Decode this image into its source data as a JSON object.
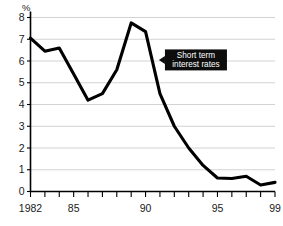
{
  "chart_data": {
    "type": "line",
    "title": "",
    "subtitle": "",
    "xlabel": "",
    "ylabel": "%",
    "unit_label": "%",
    "xlim": [
      1982,
      1999
    ],
    "ylim": [
      0,
      8
    ],
    "grid": true,
    "legend_position": "none",
    "y_ticks": [
      "8",
      "7",
      "6",
      "5",
      "4",
      "3",
      "2",
      "1",
      "0"
    ],
    "y_tick_values": [
      8,
      7,
      6,
      5,
      4,
      3,
      2,
      1,
      0
    ],
    "x_ticks": [
      "1982",
      "85",
      "90",
      "95",
      "99"
    ],
    "x_tick_values": [
      1982,
      1985,
      1990,
      1995,
      1999
    ],
    "x_minor_tick_values": [
      1982,
      1983,
      1984,
      1985,
      1986,
      1987,
      1988,
      1989,
      1990,
      1991,
      1992,
      1993,
      1994,
      1995,
      1996,
      1997,
      1998,
      1999
    ],
    "series": [
      {
        "name": "Short term interest rates",
        "color": "#000000",
        "x": [
          1982,
          1983,
          1984,
          1985,
          1986,
          1987,
          1988,
          1989,
          1990,
          1991,
          1992,
          1993,
          1994,
          1995,
          1996,
          1997,
          1998,
          1999
        ],
        "values": [
          7.05,
          6.45,
          6.6,
          5.4,
          4.2,
          4.5,
          5.6,
          7.75,
          7.35,
          4.5,
          3.0,
          2.0,
          1.2,
          0.62,
          0.6,
          0.7,
          0.3,
          0.42
        ]
      }
    ],
    "annotations": [
      {
        "name": "short-term-interest-rates-callout",
        "line1": "Short term",
        "line2": "interest rates",
        "x": 1991.0,
        "y": 6.05,
        "style": "black-box-white-text-with-left-pointer"
      }
    ],
    "colors": {
      "line": "#000000",
      "grid": "#c8c8c8",
      "axis": "#000000",
      "background": "#ffffff",
      "callout_background": "#0d0d0d",
      "callout_text": "#ffffff"
    }
  }
}
